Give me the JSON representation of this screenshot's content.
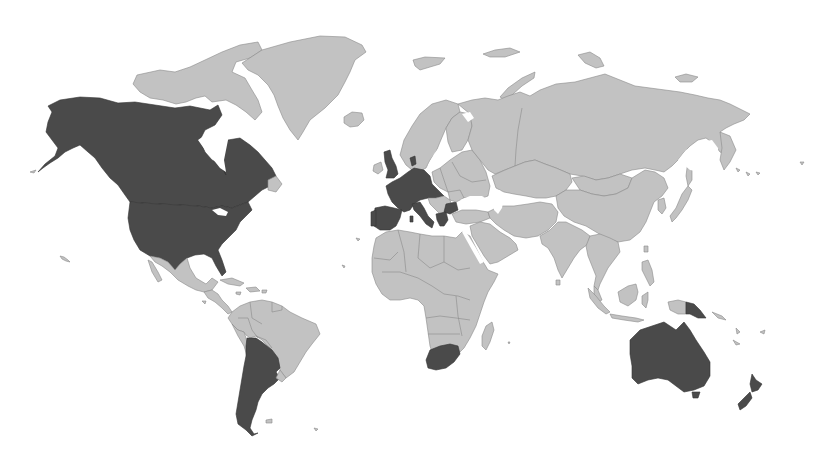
{
  "map": {
    "type": "choropleth",
    "projection": "world",
    "colors": {
      "background": "#ffffff",
      "default_land": "#c2c2c2",
      "highlighted": "#4a4a4a",
      "border": "#8a8a8a"
    },
    "highlighted_countries": [
      "United States",
      "Canada",
      "United Kingdom",
      "Ireland",
      "France",
      "Spain",
      "Portugal",
      "Germany",
      "Netherlands",
      "Belgium",
      "Denmark",
      "Switzerland",
      "Austria",
      "Italy",
      "Greece",
      "Bulgaria",
      "Argentina",
      "South Africa",
      "Australia",
      "New Zealand",
      "Papua New Guinea"
    ],
    "legend": null,
    "title": null
  }
}
